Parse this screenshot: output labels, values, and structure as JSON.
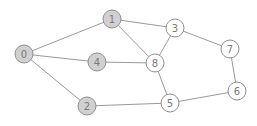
{
  "diagram": {
    "type": "undirected-graph",
    "colors": {
      "highlighted_fill": "#d0d0d0",
      "normal_fill": "#ffffff",
      "stroke": "#8f8f8f",
      "edge": "#9a9a9a",
      "label": "#7a7a7a"
    },
    "node_radius": 9,
    "nodes": [
      {
        "id": "0",
        "label": "0",
        "x": 24,
        "y": 54,
        "highlighted": true
      },
      {
        "id": "1",
        "label": "1",
        "x": 112,
        "y": 19,
        "highlighted": true
      },
      {
        "id": "2",
        "label": "2",
        "x": 87,
        "y": 106,
        "highlighted": true
      },
      {
        "id": "3",
        "label": "3",
        "x": 175,
        "y": 28,
        "highlighted": false
      },
      {
        "id": "4",
        "label": "4",
        "x": 97,
        "y": 62,
        "highlighted": true
      },
      {
        "id": "5",
        "label": "5",
        "x": 170,
        "y": 103,
        "highlighted": false
      },
      {
        "id": "6",
        "label": "6",
        "x": 237,
        "y": 91,
        "highlighted": false
      },
      {
        "id": "7",
        "label": "7",
        "x": 230,
        "y": 49,
        "highlighted": false
      },
      {
        "id": "8",
        "label": "8",
        "x": 155,
        "y": 63,
        "highlighted": false
      }
    ],
    "edges": [
      [
        "0",
        "1"
      ],
      [
        "0",
        "4"
      ],
      [
        "0",
        "2"
      ],
      [
        "1",
        "3"
      ],
      [
        "1",
        "8"
      ],
      [
        "4",
        "8"
      ],
      [
        "3",
        "8"
      ],
      [
        "3",
        "7"
      ],
      [
        "7",
        "6"
      ],
      [
        "6",
        "5"
      ],
      [
        "5",
        "8"
      ],
      [
        "2",
        "5"
      ]
    ]
  }
}
